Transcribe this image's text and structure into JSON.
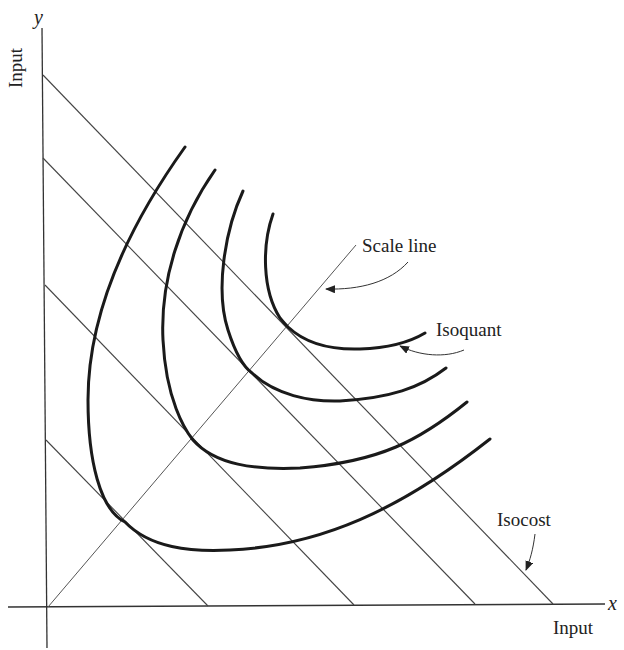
{
  "diagram": {
    "axes": {
      "x": {
        "variable": "x",
        "label": "Input"
      },
      "y": {
        "variable": "y",
        "label": "Input"
      }
    },
    "annotations": {
      "scale_line": "Scale line",
      "isoquant": "Isoquant",
      "isocost": "Isocost"
    },
    "isocost_lines": [
      {
        "y_intercept_px": 440,
        "x_intercept_px": 208
      },
      {
        "y_intercept_px": 285,
        "x_intercept_px": 354
      },
      {
        "y_intercept_px": 158,
        "x_intercept_px": 475
      },
      {
        "y_intercept_px": 75,
        "x_intercept_px": 553
      }
    ],
    "isoquant_count": 4,
    "colors": {
      "line": "#1a1a1a",
      "background": "#ffffff"
    }
  }
}
